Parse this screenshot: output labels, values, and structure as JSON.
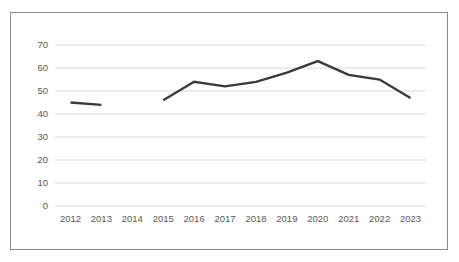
{
  "chart_data": {
    "type": "line",
    "title": "",
    "xlabel": "",
    "ylabel": "",
    "categories": [
      "2012",
      "2013",
      "2014",
      "2015",
      "2016",
      "2017",
      "2018",
      "2019",
      "2020",
      "2021",
      "2022",
      "2023"
    ],
    "series": [
      {
        "name": "series-1",
        "values": [
          45,
          44,
          null,
          46,
          54,
          52,
          54,
          58,
          63,
          57,
          55,
          47
        ]
      }
    ],
    "missing_categories": [
      "2014"
    ],
    "ylim": [
      0,
      70
    ],
    "yticks": [
      0,
      10,
      20,
      30,
      40,
      50,
      60,
      70
    ],
    "grid": "horizontal",
    "legend_position": "none",
    "colors": {
      "line": "#3a3a3a",
      "gridline": "#d9d9d9",
      "tick_label": "#595959",
      "frame_border": "#8a8a8a",
      "background": "#ffffff"
    }
  }
}
